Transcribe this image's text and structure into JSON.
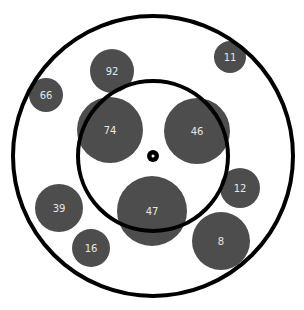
{
  "colors": {
    "background": "#ffffff",
    "bubble": "#4d4d4d",
    "ring": "#000000",
    "label": "#e6e6e6"
  },
  "center": {
    "x": 153,
    "y": 156
  },
  "rings": [
    {
      "name": "outer-ring",
      "r": 140,
      "stroke_width": 4
    },
    {
      "name": "inner-ring",
      "r": 75,
      "stroke_width": 4
    }
  ],
  "center_dot": {
    "r": 6,
    "inner_r": 1.5
  },
  "bubbles": [
    {
      "label": "92",
      "x": 112,
      "y": 71,
      "r": 22
    },
    {
      "label": "11",
      "x": 230,
      "y": 57,
      "r": 16
    },
    {
      "label": "66",
      "x": 46,
      "y": 95,
      "r": 17
    },
    {
      "label": "74",
      "x": 110,
      "y": 130,
      "r": 33
    },
    {
      "label": "46",
      "x": 197,
      "y": 131,
      "r": 33
    },
    {
      "label": "12",
      "x": 240,
      "y": 188,
      "r": 20
    },
    {
      "label": "39",
      "x": 59,
      "y": 208,
      "r": 24
    },
    {
      "label": "47",
      "x": 152,
      "y": 211,
      "r": 35
    },
    {
      "label": "16",
      "x": 91,
      "y": 248,
      "r": 19
    },
    {
      "label": "8",
      "x": 221,
      "y": 241,
      "r": 29
    }
  ]
}
